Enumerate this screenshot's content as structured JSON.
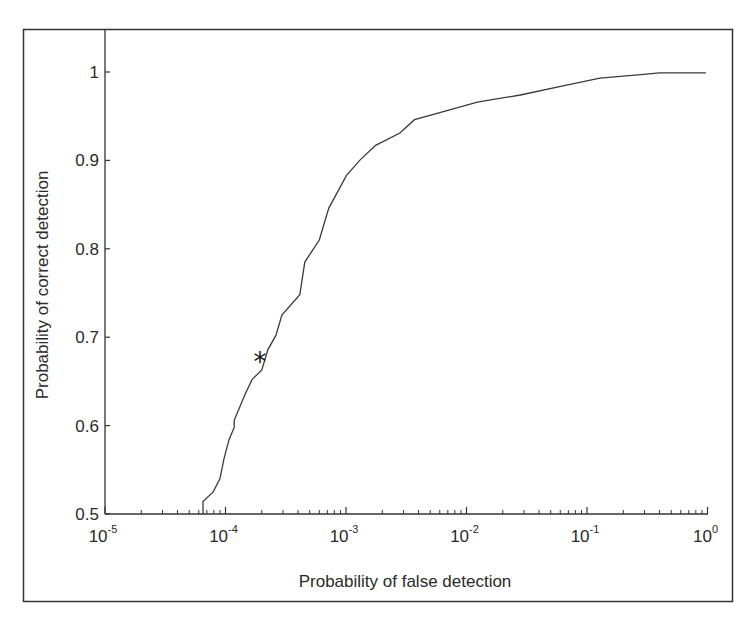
{
  "figure": {
    "frame_color": "#333333",
    "line_color": "#3a3a3a",
    "background": "#ffffff"
  },
  "chart_data": {
    "type": "line",
    "title": "",
    "xlabel": "Probability of false detection",
    "ylabel": "Probability of correct detection",
    "xscale": "log",
    "xlim": [
      1e-05,
      1
    ],
    "ylim": [
      0.5,
      1.05
    ],
    "grid": false,
    "legend": null,
    "x_ticks": [
      {
        "value": 1e-05,
        "base": "10",
        "exp": "-5"
      },
      {
        "value": 0.0001,
        "base": "10",
        "exp": "-4"
      },
      {
        "value": 0.001,
        "base": "10",
        "exp": "-3"
      },
      {
        "value": 0.01,
        "base": "10",
        "exp": "-2"
      },
      {
        "value": 0.1,
        "base": "10",
        "exp": "-1"
      },
      {
        "value": 1,
        "base": "10",
        "exp": "0"
      }
    ],
    "y_ticks": [
      {
        "value": 0.5,
        "label": "0.5"
      },
      {
        "value": 0.6,
        "label": "0.6"
      },
      {
        "value": 0.7,
        "label": "0.7"
      },
      {
        "value": 0.8,
        "label": "0.8"
      },
      {
        "value": 0.9,
        "label": "0.9"
      },
      {
        "value": 1.0,
        "label": "1"
      }
    ],
    "series": [
      {
        "name": "ROC curve",
        "x": [
          6.5e-05,
          6.5e-05,
          7.9e-05,
          9e-05,
          9.7e-05,
          0.000107,
          0.000118,
          0.000118,
          0.000145,
          0.000166,
          0.0002,
          0.000225,
          0.000262,
          0.000294,
          0.000414,
          0.000455,
          0.0006,
          0.00072,
          0.00101,
          0.0013,
          0.00176,
          0.0028,
          0.0037,
          0.006,
          0.0123,
          0.028,
          0.066,
          0.128,
          0.28,
          0.4,
          0.97
        ],
        "y": [
          0.5,
          0.514,
          0.525,
          0.54,
          0.562,
          0.584,
          0.598,
          0.606,
          0.635,
          0.652,
          0.663,
          0.686,
          0.702,
          0.725,
          0.748,
          0.785,
          0.81,
          0.846,
          0.883,
          0.9,
          0.917,
          0.931,
          0.946,
          0.954,
          0.966,
          0.974,
          0.985,
          0.993,
          0.997,
          0.999,
          0.999
        ]
      }
    ],
    "annotations": [
      {
        "type": "marker",
        "symbol": "*",
        "x": 0.000193,
        "y": 0.678,
        "label": "operating point"
      }
    ]
  }
}
